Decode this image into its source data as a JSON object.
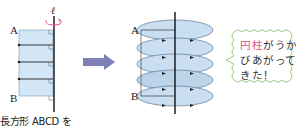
{
  "figure": {
    "left": {
      "axis_label": "ℓ",
      "vertex_top": "A",
      "vertex_bottom": "B",
      "caption": "長方形 ABCD を"
    },
    "right": {
      "vertex_top": "A",
      "vertex_bottom": "B"
    },
    "bubble": {
      "highlight": "円柱",
      "text": "がうかびあがってきた！"
    },
    "colors": {
      "rect_fill": "#d3e6f5",
      "disc_fill": "#c9def0",
      "arrow": "#8080b8",
      "bubble_border": "#8cc878",
      "highlight": "#e0508c",
      "rotation_arrow": "#e0508c"
    }
  }
}
